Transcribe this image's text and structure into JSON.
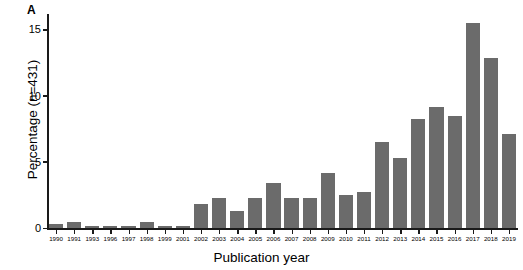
{
  "panel": {
    "letter": "A"
  },
  "chart_data": {
    "type": "bar",
    "title": "",
    "xlabel": "Publication year",
    "ylabel": "Percentage (n=431)",
    "categories": [
      "1990",
      "1991",
      "1993",
      "1996",
      "1997",
      "1998",
      "1999",
      "2001",
      "2002",
      "2003",
      "2004",
      "2005",
      "2006",
      "2007",
      "2008",
      "2009",
      "2010",
      "2011",
      "2012",
      "2013",
      "2014",
      "2015",
      "2016",
      "2017",
      "2018",
      "2019"
    ],
    "values": [
      0.35,
      0.45,
      0.2,
      0.2,
      0.2,
      0.45,
      0.2,
      0.2,
      1.85,
      2.3,
      1.35,
      2.3,
      3.45,
      2.3,
      2.3,
      4.15,
      2.5,
      2.75,
      6.5,
      5.3,
      8.3,
      9.2,
      8.5,
      15.5,
      12.9,
      7.1
    ],
    "ylim": [
      0,
      16.2
    ],
    "yticks": [
      0,
      5,
      10,
      15
    ],
    "ytick_labels": [
      "0",
      "5",
      "10",
      "15"
    ],
    "grid": false,
    "legend": false,
    "bar_color": "#6b6b6b",
    "axis_color": "#1a1a1a"
  }
}
